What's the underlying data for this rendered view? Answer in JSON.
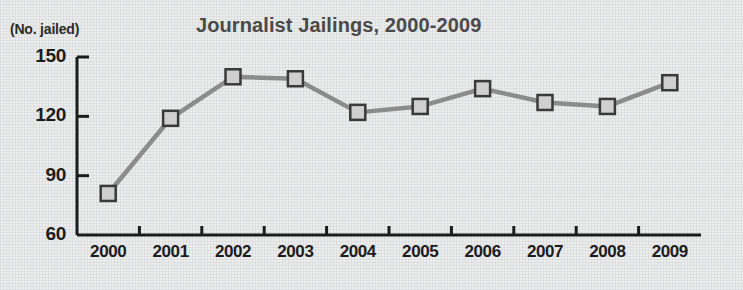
{
  "chart_data": {
    "type": "line",
    "title": "Journalist Jailings, 2000-2009",
    "xlabel": "",
    "ylabel": "(No. jailed)",
    "ylim": [
      60,
      150
    ],
    "yticks": [
      60,
      90,
      120,
      150
    ],
    "grid": false,
    "legend": null,
    "categories": [
      "2000",
      "2001",
      "2002",
      "2003",
      "2004",
      "2005",
      "2006",
      "2007",
      "2008",
      "2009"
    ],
    "series": [
      {
        "name": "Journalists jailed",
        "values": [
          81,
          119,
          140,
          139,
          122,
          125,
          134,
          127,
          125,
          137
        ]
      }
    ],
    "colors": {
      "line": "#8c8c8c",
      "marker_fill": "#cfcfcf",
      "marker_edge": "#3a3a3a",
      "axis": "#1c1c1c",
      "title_text": "#4a4a4a",
      "tick_text": "#1c1c1c",
      "background": "#eceded"
    }
  },
  "labels": {
    "unit_caption": "(No. jailed)",
    "title": "Journalist Jailings, 2000-2009"
  }
}
